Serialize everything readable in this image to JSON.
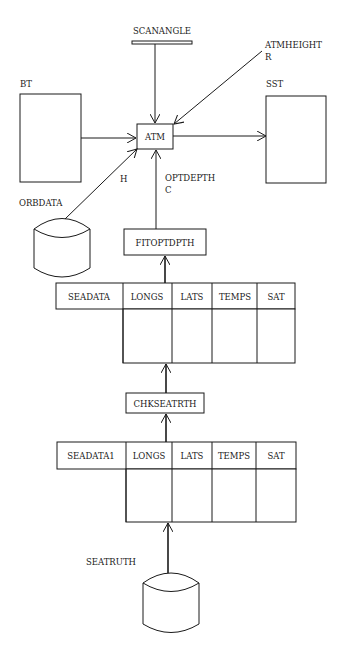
{
  "diagram": {
    "type": "data-flow",
    "nodes": {
      "scanangle": {
        "label": "SCANANGLE",
        "kind": "parameter-bar"
      },
      "atmheight": {
        "label": "ATMHEIGHT",
        "sub": "R"
      },
      "bt": {
        "label": "BT",
        "kind": "store-box"
      },
      "sst": {
        "label": "SST",
        "kind": "store-box"
      },
      "atm": {
        "label": "ATM",
        "kind": "process"
      },
      "orbdata": {
        "label": "ORBDATA",
        "kind": "disk"
      },
      "fitoptdpth": {
        "label": "FITOPTDPTH",
        "kind": "process"
      },
      "chkseatrth": {
        "label": "CHKSEATRTH",
        "kind": "process"
      },
      "seatruth": {
        "label": "SEATRUTH",
        "kind": "disk"
      }
    },
    "edge_labels": {
      "orbdata_to_atm": "H",
      "optdepth": "OPTDEPTH",
      "optdepth_sub": "C"
    },
    "tables": [
      {
        "name": "SEADATA",
        "columns": [
          "LONGS",
          "LATS",
          "TEMPS",
          "SAT"
        ]
      },
      {
        "name": "SEADATA1",
        "columns": [
          "LONGS",
          "LATS",
          "TEMPS",
          "SAT"
        ]
      }
    ]
  }
}
